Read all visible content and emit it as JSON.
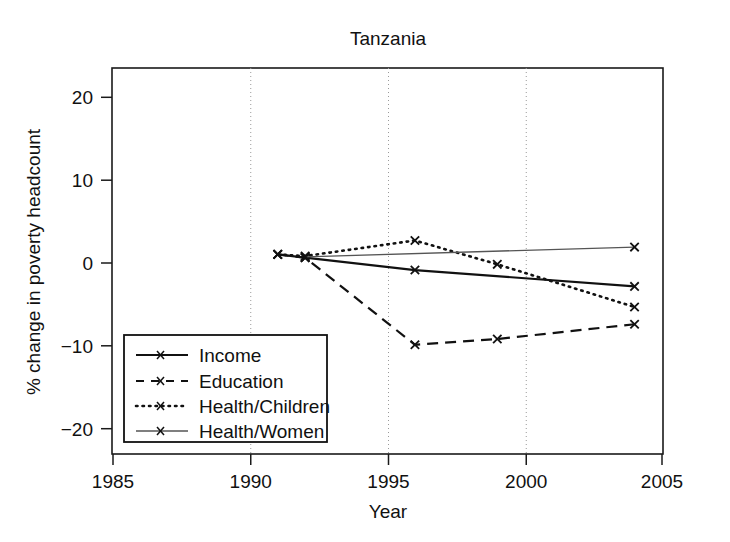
{
  "chart_data": {
    "type": "line",
    "title": "Tanzania",
    "xlabel": "Year",
    "ylabel": "% change in poverty headcount",
    "xlim": [
      1985,
      2005
    ],
    "ylim": [
      -23.5,
      23.5
    ],
    "xticks": [
      "1985",
      "1990",
      "1995",
      "2000",
      "2005"
    ],
    "xtick_values": [
      1985,
      1990,
      1995,
      2000,
      2005
    ],
    "yticks": [
      "20",
      "10",
      "0",
      "−10",
      "−20"
    ],
    "ytick_values": [
      20,
      10,
      0,
      -10,
      -20
    ],
    "grid": "vertical dotted at 1990, 1995, 2000",
    "legend_position": "lower left inside axes",
    "series": [
      {
        "name": "Income",
        "style": "solid",
        "x": [
          1991,
          1992,
          1996,
          2004
        ],
        "values": [
          0.8,
          0.4,
          -1.1,
          -3.1
        ],
        "markers_at": [
          1991,
          1992,
          1996,
          2004
        ]
      },
      {
        "name": "Education",
        "style": "dashed",
        "x": [
          1991,
          1992,
          1996,
          1999,
          2004
        ],
        "values": [
          0.8,
          0.4,
          -10.2,
          -9.5,
          -7.7
        ],
        "markers_at": [
          1991,
          1992,
          1996,
          1999,
          2004
        ]
      },
      {
        "name": "Health/Children",
        "style": "dotted",
        "x": [
          1991,
          1992,
          1996,
          1999,
          2004
        ],
        "values": [
          0.8,
          0.6,
          2.5,
          -0.4,
          -5.6
        ],
        "markers_at": [
          1991,
          1992,
          1996,
          1999,
          2004
        ]
      },
      {
        "name": "Health/Women",
        "style": "thin-solid",
        "x": [
          1992,
          2004
        ],
        "values": [
          0.5,
          1.7
        ],
        "markers_at": [
          1992,
          2004
        ]
      }
    ],
    "legend_entries": [
      {
        "label": "Income",
        "style": "solid"
      },
      {
        "label": "Education",
        "style": "dashed"
      },
      {
        "label": "Health/Children",
        "style": "dotted"
      },
      {
        "label": "Health/Women",
        "style": "thin-solid"
      }
    ],
    "colors": {
      "axis": "#1a1a1a",
      "grid": "#9a9a9a",
      "income": "#111111",
      "education": "#111111",
      "health_children": "#111111",
      "health_women": "#555555",
      "background": "#ffffff"
    }
  }
}
